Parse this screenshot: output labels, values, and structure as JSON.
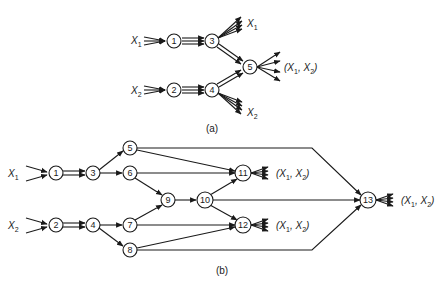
{
  "figure_a": {
    "caption": "(a)",
    "nodes": [
      {
        "id": "1",
        "x": 174,
        "y": 41
      },
      {
        "id": "2",
        "x": 174,
        "y": 90
      },
      {
        "id": "3",
        "x": 212,
        "y": 41
      },
      {
        "id": "4",
        "x": 212,
        "y": 90
      },
      {
        "id": "5",
        "x": 250,
        "y": 67
      }
    ],
    "labels": {
      "in1": "X",
      "in1_sub": "1",
      "in2": "X",
      "in2_sub": "2",
      "out3": "X",
      "out3_sub": "1",
      "out4": "X",
      "out4_sub": "2",
      "out5_pre": "(X",
      "out5_sub1": "1",
      "out5_mid": ", X",
      "out5_sub2": "2",
      "out5_post": ")"
    }
  },
  "figure_b": {
    "caption": "(b)",
    "nodes": [
      {
        "id": "1",
        "x": 56,
        "y": 173
      },
      {
        "id": "2",
        "x": 56,
        "y": 225
      },
      {
        "id": "3",
        "x": 93,
        "y": 173
      },
      {
        "id": "4",
        "x": 93,
        "y": 225
      },
      {
        "id": "5",
        "x": 130,
        "y": 148
      },
      {
        "id": "6",
        "x": 130,
        "y": 173
      },
      {
        "id": "7",
        "x": 130,
        "y": 225
      },
      {
        "id": "8",
        "x": 130,
        "y": 250
      },
      {
        "id": "9",
        "x": 168,
        "y": 200
      },
      {
        "id": "10",
        "x": 205,
        "y": 200
      },
      {
        "id": "11",
        "x": 243,
        "y": 173
      },
      {
        "id": "12",
        "x": 243,
        "y": 225
      },
      {
        "id": "13",
        "x": 368,
        "y": 200
      }
    ],
    "labels": {
      "in1": "X",
      "in1_sub": "1",
      "in2": "X",
      "in2_sub": "2",
      "out_pre": "(X",
      "out_sub1": "1",
      "out_mid": ", X",
      "out_sub2": "2",
      "out_post": ")"
    }
  }
}
